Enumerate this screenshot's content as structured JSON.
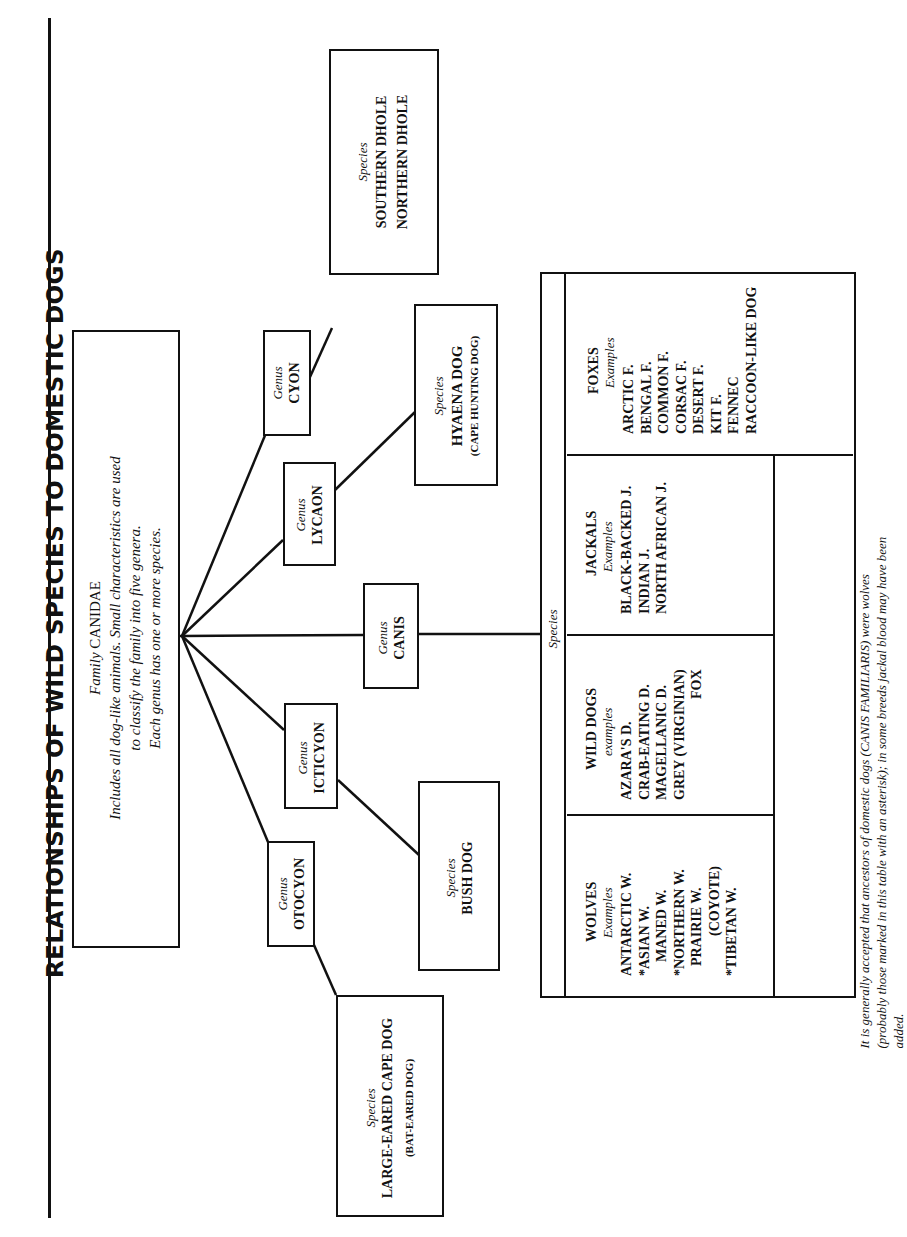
{
  "title": "RELATIONSHIPS OF WILD SPECIES TO DOMESTIC DOGS",
  "family": {
    "label": "Family",
    "name": "CANIDAE",
    "description_lines": [
      "Includes all dog-like animals. Small characteristics are used",
      "to classify the family into five genera.",
      "Each genus has one or more species."
    ]
  },
  "genera": [
    {
      "label": "Genus",
      "name": "CYON"
    },
    {
      "label": "Genus",
      "name": "LYCAON"
    },
    {
      "label": "Genus",
      "name": "CANIS"
    },
    {
      "label": "Genus",
      "name": "ICTICYON"
    },
    {
      "label": "Genus",
      "name": "OTOCYON"
    }
  ],
  "species_boxes": {
    "cyon": {
      "label": "Species",
      "lines": [
        "SOUTHERN DHOLE",
        "NORTHERN DHOLE"
      ]
    },
    "lycaon": {
      "label": "Species",
      "lines": [
        "HYAENA DOG"
      ],
      "sub": "(CAPE HUNTING DOG)"
    },
    "icticyon": {
      "label": "Species",
      "lines": [
        "BUSH DOG"
      ]
    },
    "otocyon": {
      "label": "Species",
      "lines": [
        "LARGE-EARED CAPE DOG"
      ],
      "sub": "(BAT-EARED DOG)"
    }
  },
  "canis_table": {
    "species_label": "Species",
    "groups": [
      {
        "name": "FOXES",
        "examples_label": "Examples",
        "items": [
          "ARCTIC F.",
          "BENGAL F.",
          "COMMON F.",
          "CORSAC F.",
          "DESERT F.",
          "KIT F.",
          "FENNEC",
          "RACCOON-LIKE DOG"
        ]
      },
      {
        "name": "JACKALS",
        "examples_label": "Examples",
        "items": [
          "BLACK-BACKED J.",
          "INDIAN J.",
          "NORTH AFRICAN J."
        ]
      },
      {
        "name": "WILD DOGS",
        "examples_label": "examples",
        "items": [
          "AZARA'S D.",
          "CRAB-EATING D.",
          "MAGELLANIC D.",
          "GREY (VIRGINIAN)",
          "FOX"
        ]
      },
      {
        "name": "WOLVES",
        "examples_label": "Examples",
        "items": [
          "ANTARCTIC W.",
          "*ASIAN W.",
          "MANED W.",
          "*NORTHERN W.",
          "PRAIRIE W.",
          "(COYOTE)",
          "*TIBETAN W."
        ]
      }
    ],
    "note": "It is generally accepted that ancestors of domestic dogs (CANIS FAMILIARIS) were wolves (probably those marked in this table with an asterisk); in some breeds jackal blood may have been added."
  },
  "colors": {
    "ink": "#111111",
    "paper": "#ffffff"
  }
}
